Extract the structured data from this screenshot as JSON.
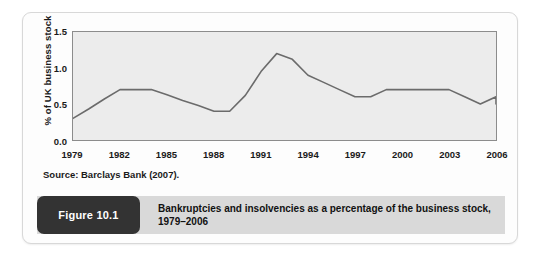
{
  "figure": {
    "badge_label": "Figure 10.1",
    "caption_line1": "Bankruptcies and insolvencies as a percentage of the business stock,",
    "caption_line2": "1979–2006",
    "source_note": "Source: Barclays Bank (2007).",
    "badge_color": "#333333",
    "caption_bar_color": "#d9d9d9",
    "card_background": "#fdfdfd"
  },
  "chart_data": {
    "type": "line",
    "title": "",
    "subtitle": "",
    "xlabel": "",
    "ylabel": "% of UK business stock",
    "xlim": [
      1979,
      2006
    ],
    "ylim": [
      0.0,
      1.5
    ],
    "grid": false,
    "legend": "none",
    "plot_background": "#ececec",
    "line_color": "#6b6b6b",
    "y_ticks": [
      0.0,
      0.5,
      1.0,
      1.5
    ],
    "y_tick_labels": [
      "0.0",
      "0.5",
      "1.0",
      "1.5"
    ],
    "x_ticks": [
      1979,
      1982,
      1985,
      1988,
      1991,
      1994,
      1997,
      2000,
      2003,
      2006
    ],
    "x_tick_labels": [
      "1979",
      "1982",
      "1985",
      "1988",
      "1991",
      "1994",
      "1997",
      "2000",
      "2003",
      "2006"
    ],
    "x": [
      1979,
      1980,
      1981,
      1982,
      1983,
      1984,
      1985,
      1986,
      1987,
      1988,
      1989,
      1990,
      1991,
      1992,
      1993,
      1994,
      1995,
      1996,
      1997,
      1998,
      1999,
      2000,
      2001,
      2002,
      2003,
      2004,
      2005,
      2006
    ],
    "values": [
      0.3,
      0.43,
      0.57,
      0.7,
      0.7,
      0.7,
      0.63,
      0.55,
      0.48,
      0.4,
      0.4,
      0.62,
      0.95,
      1.2,
      1.12,
      0.9,
      0.8,
      0.7,
      0.6,
      0.6,
      0.7,
      0.7,
      0.7,
      0.7,
      0.7,
      0.6,
      0.5,
      0.6
    ],
    "series": [
      {
        "name": "Bankruptcies and insolvencies (% of UK business stock)",
        "values": [
          0.3,
          0.43,
          0.57,
          0.7,
          0.7,
          0.7,
          0.63,
          0.55,
          0.48,
          0.4,
          0.4,
          0.62,
          0.95,
          1.2,
          1.12,
          0.9,
          0.8,
          0.7,
          0.6,
          0.6,
          0.7,
          0.7,
          0.7,
          0.7,
          0.7,
          0.6,
          0.5,
          0.6
        ]
      }
    ],
    "end_value": 0.5
  }
}
